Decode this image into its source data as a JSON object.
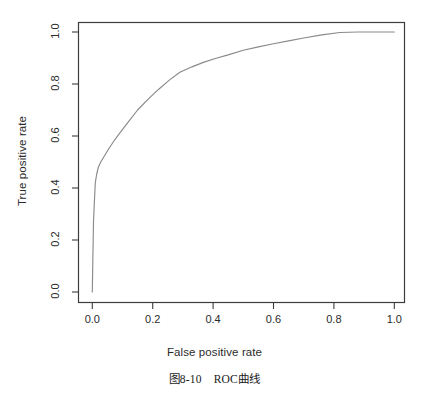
{
  "figure": {
    "caption_prefix": "图8-10",
    "caption_text": "ROC曲线"
  },
  "chart_data": {
    "type": "line",
    "title": "",
    "xlabel": "False positive rate",
    "ylabel": "True positive rate",
    "xlim": [
      0.0,
      1.0
    ],
    "ylim": [
      0.0,
      1.0
    ],
    "grid": false,
    "legend": null,
    "line_color": "#8a8a8a",
    "box_color": "#3c3c3c",
    "xticks": [
      "0.0",
      "0.2",
      "0.4",
      "0.6",
      "0.8",
      "1.0"
    ],
    "xtick_values": [
      0.0,
      0.2,
      0.4,
      0.6,
      0.8,
      1.0
    ],
    "yticks": [
      "0.0",
      "0.2",
      "0.4",
      "0.6",
      "0.8",
      "1.0"
    ],
    "ytick_values": [
      0.0,
      0.2,
      0.4,
      0.6,
      0.8,
      1.0
    ],
    "series": [
      {
        "name": "ROC curve",
        "x": [
          0.0,
          0.002,
          0.004,
          0.007,
          0.01,
          0.014,
          0.02,
          0.028,
          0.04,
          0.055,
          0.07,
          0.087,
          0.12,
          0.15,
          0.185,
          0.22,
          0.255,
          0.29,
          0.33,
          0.37,
          0.41,
          0.45,
          0.5,
          0.55,
          0.6,
          0.65,
          0.7,
          0.76,
          0.82,
          0.88,
          0.94,
          1.0
        ],
        "y": [
          0.0,
          0.14,
          0.27,
          0.35,
          0.42,
          0.45,
          0.48,
          0.5,
          0.523,
          0.552,
          0.578,
          0.605,
          0.655,
          0.7,
          0.742,
          0.78,
          0.815,
          0.845,
          0.866,
          0.884,
          0.899,
          0.912,
          0.93,
          0.943,
          0.955,
          0.966,
          0.977,
          0.989,
          0.998,
          1.0,
          1.0,
          1.0
        ]
      }
    ]
  }
}
